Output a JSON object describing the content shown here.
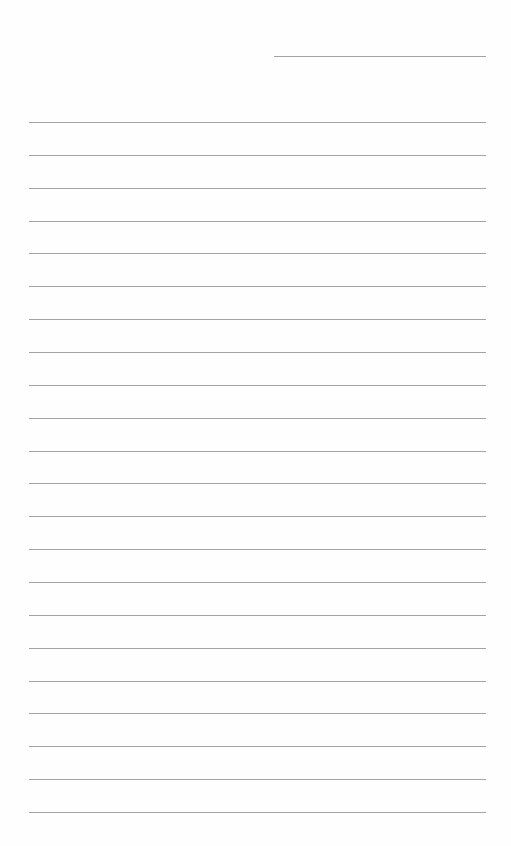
{
  "page": {
    "type": "lined-paper",
    "background_color": "#fefefe",
    "line_color": "#a3a3a3",
    "header_line": {
      "label": "date-line",
      "x": 274,
      "y": 56,
      "width": 212
    },
    "rules": {
      "count": 22,
      "x": 29,
      "width": 457,
      "first_y": 122,
      "spacing": 32.86
    },
    "text_lines": []
  }
}
